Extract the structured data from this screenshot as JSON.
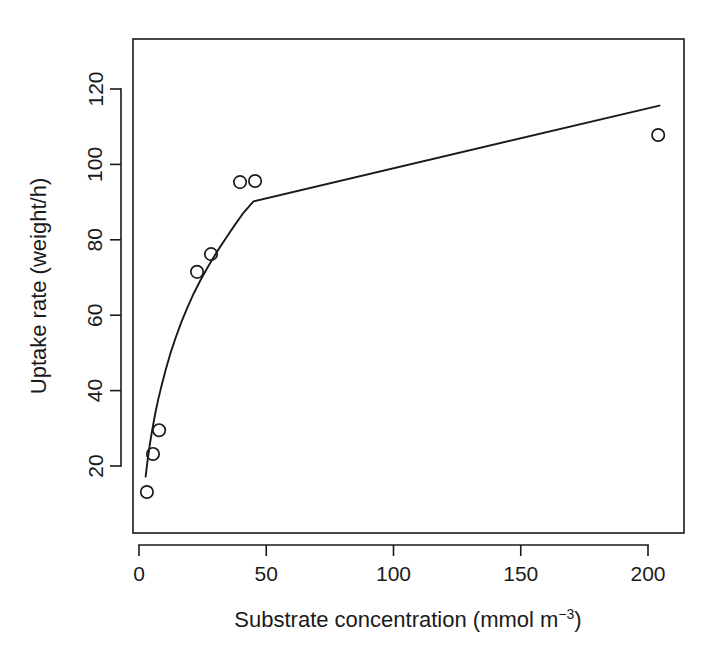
{
  "chart_data": {
    "type": "scatter",
    "title": "",
    "xlabel": "Substrate concentration (mmol m⁻³)",
    "xlabel_main": "Substrate concentration (mmol m",
    "xlabel_sup": "−3",
    "xlabel_tail": ")",
    "ylabel": "Uptake rate (weight/h)",
    "xlim": [
      -5,
      215
    ],
    "ylim": [
      10,
      130
    ],
    "xticks": [
      0,
      50,
      100,
      150,
      200
    ],
    "xtick_labels": [
      "0",
      "50",
      "100",
      "150",
      "200"
    ],
    "yticks": [
      20,
      40,
      60,
      80,
      100,
      120
    ],
    "ytick_labels": [
      "20",
      "40",
      "60",
      "80",
      "100",
      "120"
    ],
    "grid": false,
    "legend": null,
    "marker": "open-circle",
    "point_color": "#1a1a1a",
    "line_color": "#1a1a1a",
    "background": "#ffffff",
    "series": [
      {
        "name": "observed uptake",
        "type": "scatter",
        "x": [
          3.1,
          5.5,
          7.9,
          22.8,
          28.3,
          39.7,
          45.6,
          204.0
        ],
        "y": [
          13.1,
          23.2,
          29.5,
          71.5,
          76.2,
          95.3,
          95.6,
          107.8
        ]
      },
      {
        "name": "fitted curve",
        "type": "line",
        "x": [
          2.6,
          3.4,
          4.2,
          5.2,
          6.4,
          7.6,
          9.0,
          10.6,
          12.4,
          14.4,
          16.6,
          19.0,
          21.6,
          24.4,
          27.4,
          30.6,
          34.0,
          37.6,
          41.2,
          45.0,
          204.5
        ],
        "y": [
          17.2,
          21.6,
          25.5,
          29.6,
          34.0,
          37.8,
          41.7,
          45.8,
          50.0,
          54.0,
          58.1,
          62.0,
          65.9,
          69.6,
          73.2,
          76.8,
          80.3,
          83.9,
          87.3,
          90.2,
          115.6
        ]
      }
    ],
    "annotations": []
  },
  "figure": {
    "plot_box": {
      "left": 133,
      "top": 39,
      "right": 684,
      "bottom": 533
    }
  }
}
